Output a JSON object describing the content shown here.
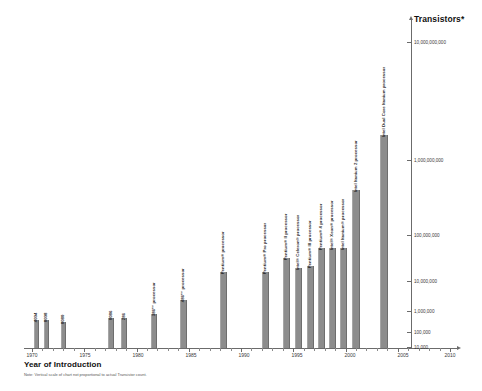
{
  "chart_data": {
    "type": "bar",
    "title": "Transistors*",
    "xlabel": "Year of Introduction",
    "ylabel": "Transistors*",
    "yscale": "log",
    "ylim": [
      10000,
      10000000000
    ],
    "xlim": [
      1970,
      2010
    ],
    "grid": false,
    "legend": null,
    "note": "Note: Vertical scale of chart not proportional to actual Transistor count.",
    "y_ticks": [
      {
        "label": "10,000,000,000",
        "value": 10000000000
      },
      {
        "label": "1,000,000,000",
        "value": 1000000000
      },
      {
        "label": "100,000,000",
        "value": 100000000
      },
      {
        "label": "10,000,000",
        "value": 10000000
      },
      {
        "label": "1,000,000",
        "value": 1000000
      },
      {
        "label": "100,000",
        "value": 100000
      },
      {
        "label": "10,000",
        "value": 10000
      }
    ],
    "x_ticks": [
      "1970",
      "1975",
      "1980",
      "1985",
      "1990",
      "1995",
      "2000",
      "2005",
      "2010"
    ],
    "categories": [
      "4004",
      "8008",
      "8080",
      "8086",
      "286",
      "386™ processor",
      "486™ processor",
      "Pentium® processor",
      "Pentium® Pro processor",
      "Pentium® II processor",
      "Intel® Celeron® processor",
      "Pentium® III processor",
      "Pentium® 4 processor",
      "Intel® Xeon® processor",
      "Intel Itanium® processor",
      "Intel Itanium 2 processor",
      "Intel Dual Core Itanium processor"
    ],
    "years": [
      1971,
      1972,
      1974,
      1978,
      1982,
      1985,
      1989,
      1993,
      1995,
      1997,
      1998,
      1999,
      2000,
      2001,
      2002,
      2004,
      2006
    ],
    "values": [
      2300,
      3500,
      6000,
      29000,
      134000,
      275000,
      1200000,
      3100000,
      5500000,
      7500000,
      7500000,
      9500000,
      42000000,
      45000000,
      55000000,
      220000000,
      1720000000
    ]
  },
  "bars": [
    {
      "label": "4004",
      "x": 34,
      "top": 320,
      "w": 4.5,
      "h": 28
    },
    {
      "label": "8008",
      "x": 44,
      "top": 320,
      "w": 4.5,
      "h": 28
    },
    {
      "label": "8080",
      "x": 61,
      "top": 322,
      "w": 4.5,
      "h": 26
    },
    {
      "label": "8086",
      "x": 108,
      "top": 318,
      "w": 5.5,
      "h": 30
    },
    {
      "label": "286",
      "x": 121,
      "top": 318,
      "w": 5.5,
      "h": 30
    },
    {
      "label": "386™ processor",
      "x": 151,
      "top": 314,
      "w": 6,
      "h": 34
    },
    {
      "label": "486™ processor",
      "x": 180,
      "top": 300,
      "w": 6.5,
      "h": 48
    },
    {
      "label": "Pentium® processor",
      "x": 220,
      "top": 272,
      "w": 7,
      "h": 76
    },
    {
      "label": "Pentium® Pro processor",
      "x": 262,
      "top": 272,
      "w": 7,
      "h": 76
    },
    {
      "label": "Pentium® II processor",
      "x": 283,
      "top": 258,
      "w": 7,
      "h": 90
    },
    {
      "label": "Intel® Celeron® processor",
      "x": 295,
      "top": 268,
      "w": 7,
      "h": 80
    },
    {
      "label": "Pentium® III processor",
      "x": 307,
      "top": 266,
      "w": 7,
      "h": 82
    },
    {
      "label": "Pentium® 4 processor",
      "x": 318,
      "top": 248,
      "w": 7,
      "h": 100
    },
    {
      "label": "Intel® Xeon® processor",
      "x": 329,
      "top": 248,
      "w": 7,
      "h": 100
    },
    {
      "label": "Intel Itanium® processor",
      "x": 340,
      "top": 248,
      "w": 7,
      "h": 100
    },
    {
      "label": "Intel Itanium 2 processor",
      "x": 352,
      "top": 190,
      "w": 7.5,
      "h": 158
    },
    {
      "label": "Intel Dual Core Itanium processor",
      "x": 380,
      "top": 135,
      "w": 8,
      "h": 213
    }
  ],
  "x_axis": {
    "title": "Year of Introduction",
    "ticks": [
      {
        "label": "1970",
        "x": 32
      },
      {
        "label": "1975",
        "x": 85
      },
      {
        "label": "1980",
        "x": 138
      },
      {
        "label": "1985",
        "x": 191
      },
      {
        "label": "1990",
        "x": 244
      },
      {
        "label": "1995",
        "x": 297
      },
      {
        "label": "2000",
        "x": 350
      },
      {
        "label": "2005",
        "x": 403
      },
      {
        "label": "2010",
        "x": 450
      }
    ]
  },
  "y_axis": {
    "title": "Transistors*",
    "ticks": [
      {
        "label": "10,000,000,000",
        "y": 42
      },
      {
        "label": "1,000,000,000",
        "y": 160
      },
      {
        "label": "100,000,000",
        "y": 235
      },
      {
        "label": "10,000,000",
        "y": 281
      },
      {
        "label": "1,000,000",
        "y": 311
      },
      {
        "label": "100,000",
        "y": 332
      },
      {
        "label": "10,000",
        "y": 347
      }
    ]
  },
  "footnote": "Note: Vertical scale of chart not proportional to actual Transistor count."
}
